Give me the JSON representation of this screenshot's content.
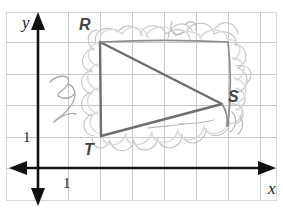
{
  "figure": {
    "kind": "coordinate-grid-geometry-sketch",
    "width": 283,
    "height": 209,
    "background_color": "#ffffff",
    "border_color": "#d8d8d8"
  },
  "grid": {
    "visible": true,
    "line_color": "#c9c9c9",
    "cell_size": 32,
    "vertical_lines_x": [
      6,
      38,
      68,
      100,
      132,
      164,
      196,
      228,
      260
    ],
    "horizontal_lines_y": [
      12,
      42,
      74,
      105,
      137,
      168,
      200
    ]
  },
  "axes": {
    "color": "#111111",
    "x_axis": {
      "label": "x",
      "y_pixel": 168,
      "from_x": 12,
      "to_x": 276,
      "double_headed": true,
      "tick_label": "1",
      "tick_label_value": 1
    },
    "y_axis": {
      "label": "y",
      "x_pixel": 38,
      "from_y": 14,
      "to_y": 200,
      "double_headed": true,
      "tick_label": "1",
      "tick_label_value": 1
    }
  },
  "triangle": {
    "name": "RST",
    "stroke_color": "#6b6b6b",
    "stroke_width": 2.4,
    "vertices": [
      {
        "label": "R",
        "x_pixel": 100,
        "y_pixel": 42,
        "grid_x": 2,
        "grid_y": 4
      },
      {
        "label": "S",
        "x_pixel": 222,
        "y_pixel": 104,
        "grid_x": 5.75,
        "grid_y": 2
      },
      {
        "label": "T",
        "x_pixel": 101,
        "y_pixel": 136,
        "grid_x": 2,
        "grid_y": 1
      }
    ],
    "edges": [
      {
        "from": "R",
        "to": "S"
      },
      {
        "from": "S",
        "to": "T"
      },
      {
        "from": "T",
        "to": "R"
      }
    ]
  },
  "annotations": {
    "description": "hand-drawn pencil cloud-shaped outline enclosing the triangle, plus a scribbled 3-like mark at left",
    "sketch_color": "#b4b4b4",
    "sketch_color_dark": "#9a9a9a",
    "scribble_mark": "3"
  }
}
